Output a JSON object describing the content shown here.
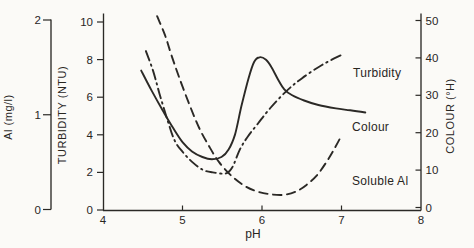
{
  "figure": {
    "background": "#fbfaf7",
    "ink": "#2b2926"
  },
  "chart_data": {
    "type": "line",
    "grid": false,
    "x_axis": {
      "label": "pH",
      "min": 4,
      "max": 8,
      "ticks": [
        4,
        5,
        6,
        7,
        8
      ]
    },
    "y_axes": [
      {
        "id": "al",
        "label": "Al (mg/l)",
        "side": "far-left",
        "min": 0,
        "max": 2,
        "ticks": [
          0,
          1,
          2
        ]
      },
      {
        "id": "turbidity",
        "label": "TURBIDITY (NTU)",
        "side": "left",
        "min": 0,
        "max": 10,
        "ticks": [
          0,
          2,
          4,
          6,
          8,
          10
        ]
      },
      {
        "id": "colour",
        "label": "COLOUR (°H)",
        "side": "right",
        "min": 0,
        "max": 50,
        "ticks": [
          0,
          10,
          20,
          30,
          40,
          50
        ]
      }
    ],
    "series": [
      {
        "name": "Turbidity",
        "axis": "turbidity",
        "line_style": "dash-dot",
        "points": [
          [
            4.54,
            8.45
          ],
          [
            4.63,
            7.4
          ],
          [
            4.71,
            6.2
          ],
          [
            4.81,
            4.8
          ],
          [
            4.9,
            3.7
          ],
          [
            5.0,
            3.1
          ],
          [
            5.11,
            2.6
          ],
          [
            5.25,
            2.15
          ],
          [
            5.38,
            2.0
          ],
          [
            5.55,
            1.95
          ],
          [
            5.63,
            2.3
          ],
          [
            5.72,
            3.2
          ],
          [
            5.82,
            3.9
          ],
          [
            5.95,
            4.6
          ],
          [
            6.1,
            5.4
          ],
          [
            6.3,
            6.3
          ],
          [
            6.5,
            7.0
          ],
          [
            6.75,
            7.7
          ],
          [
            7.0,
            8.25
          ]
        ]
      },
      {
        "name": "Colour",
        "axis": "colour",
        "line_style": "solid",
        "points": [
          [
            4.48,
            36.6
          ],
          [
            4.61,
            31.3
          ],
          [
            4.75,
            26.0
          ],
          [
            4.88,
            21.3
          ],
          [
            5.0,
            17.5
          ],
          [
            5.12,
            15.0
          ],
          [
            5.25,
            13.5
          ],
          [
            5.37,
            12.9
          ],
          [
            5.49,
            13.5
          ],
          [
            5.58,
            15.5
          ],
          [
            5.66,
            19.5
          ],
          [
            5.74,
            27.0
          ],
          [
            5.83,
            34.5
          ],
          [
            5.9,
            38.9
          ],
          [
            5.97,
            40.2
          ],
          [
            6.05,
            39.5
          ],
          [
            6.12,
            37.5
          ],
          [
            6.2,
            34.3
          ],
          [
            6.28,
            31.6
          ],
          [
            6.38,
            30.0
          ],
          [
            6.53,
            28.6
          ],
          [
            6.71,
            27.4
          ],
          [
            6.93,
            26.5
          ],
          [
            7.11,
            26.0
          ],
          [
            7.3,
            25.4
          ]
        ]
      },
      {
        "name": "Soluble Al",
        "axis": "al",
        "line_style": "dashed",
        "points": [
          [
            4.68,
            2.04
          ],
          [
            4.78,
            1.84
          ],
          [
            4.86,
            1.63
          ],
          [
            4.96,
            1.39
          ],
          [
            5.09,
            1.1
          ],
          [
            5.21,
            0.86
          ],
          [
            5.34,
            0.66
          ],
          [
            5.46,
            0.5
          ],
          [
            5.61,
            0.36
          ],
          [
            5.78,
            0.25
          ],
          [
            5.94,
            0.19
          ],
          [
            6.11,
            0.16
          ],
          [
            6.28,
            0.155
          ],
          [
            6.43,
            0.19
          ],
          [
            6.56,
            0.26
          ],
          [
            6.69,
            0.36
          ],
          [
            6.81,
            0.5
          ],
          [
            6.91,
            0.64
          ],
          [
            7.0,
            0.78
          ]
        ]
      }
    ],
    "annotations": [
      {
        "text": "Turbidity"
      },
      {
        "text": "Colour"
      },
      {
        "text": "Soluble Al"
      }
    ]
  }
}
